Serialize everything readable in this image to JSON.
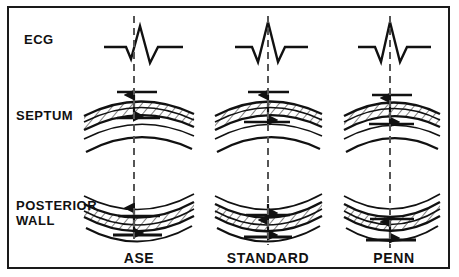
{
  "figure": {
    "border_color": "#1a1a1a",
    "background": "#ffffff",
    "ink_color": "#111111",
    "dashed_line_color": "#555555",
    "width": 459,
    "height": 277
  },
  "row_labels": {
    "ecg": "ECG",
    "septum": "SEPTUM",
    "posterior_wall": "POSTERIOR\nWALL"
  },
  "columns": [
    {
      "id": "ase",
      "label": "ASE",
      "center_x": 139,
      "ecg_timing": "onset of QRS",
      "dashed_line_x": 134,
      "septum_measure": "leading-edge to leading-edge",
      "posterior_wall_measure": "leading-edge to leading-edge"
    },
    {
      "id": "standard",
      "label": "STANDARD",
      "center_x": 268,
      "ecg_timing": "peak of R wave",
      "dashed_line_x": 268,
      "septum_measure": "leading-edge to leading-edge",
      "posterior_wall_measure": "leading-edge to leading-edge"
    },
    {
      "id": "penn",
      "label": "PENN",
      "center_x": 394,
      "ecg_timing": "peak of R wave",
      "dashed_line_x": 390,
      "septum_measure": "trailing-edge to leading-edge (endocardium excluded)",
      "posterior_wall_measure": "trailing-edge to leading-edge (endocardium excluded)"
    }
  ],
  "icons": {
    "ecg_trace": "ecg-waveform-icon",
    "septum_band": "hatched-tissue-band-icon",
    "posterior_band": "hatched-tissue-band-icon",
    "caliper_arrow": "double-headed-arrow-icon",
    "timing_line": "vertical-dashed-timing-line-icon"
  }
}
